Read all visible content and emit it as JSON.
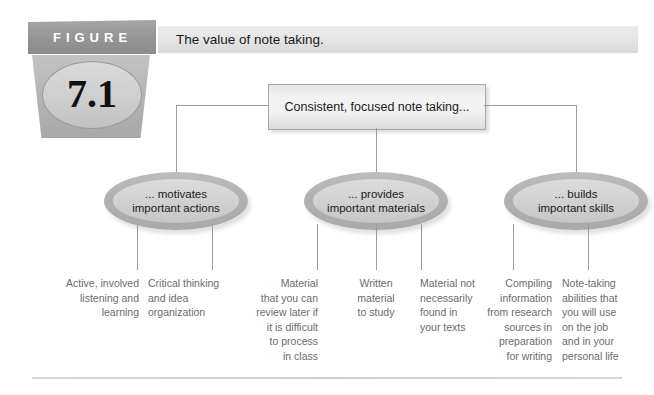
{
  "figure": {
    "badge_word": "FIGURE",
    "number": "7.1",
    "title": "The value of note taking."
  },
  "diagram": {
    "root": {
      "label": "Consistent, focused note taking..."
    },
    "branches": [
      {
        "line1": "... motivates",
        "line2": "important actions",
        "leaves": [
          "Active, involved listening and learning",
          "Critical thinking and idea organization"
        ]
      },
      {
        "line1": "... provides",
        "line2": "important materials",
        "leaves": [
          "Material that you can review later if it is difficult to process in class",
          "Written material to study",
          "Material not necessarily found in your texts"
        ]
      },
      {
        "line1": "... builds",
        "line2": "important skills",
        "leaves": [
          "Compiling information from research sources in preparation for writing",
          "Note-taking abilities that you will use on the job and in your personal life"
        ]
      }
    ],
    "leaf_text": {
      "l1": "Active, involved\nlistening and\nlearning",
      "l2": "Critical thinking\nand idea\norganization",
      "l3": "Material\nthat you can\nreview later if\nit is difficult\nto process\nin class",
      "l4": "Written\nmaterial\nto study",
      "l5": "Material not\nnecessarily\nfound in\nyour texts",
      "l6": "Compiling\ninformation\nfrom research\nsources in\npreparation\nfor writing",
      "l7": "Note-taking\nabilities that\nyou will use\non the job\nand in your\npersonal life"
    }
  },
  "colors": {
    "badge_dark": "#949494",
    "badge_light": "#b4b4b4",
    "line": "#9b9b9b",
    "oval_ring": "#b2b2b2",
    "oval_fill": "#d2d2d2",
    "leaf_text": "#6b6b6b",
    "title_strip": "#e6e6e6"
  }
}
